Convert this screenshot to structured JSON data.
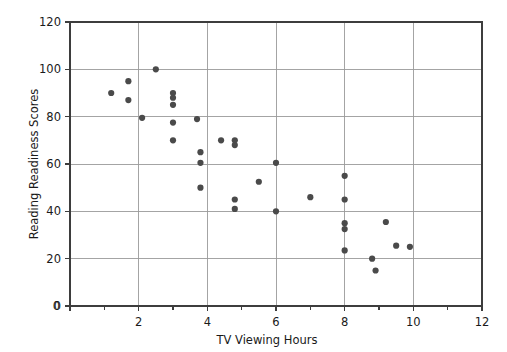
{
  "chart_data": {
    "type": "scatter",
    "title": "",
    "xlabel": "TV Viewing Hours",
    "ylabel": "Reading Readiness Scores",
    "xlim": [
      0,
      12
    ],
    "ylim": [
      0,
      120
    ],
    "x_ticks_major": [
      0,
      2,
      4,
      6,
      8,
      10,
      12
    ],
    "x_tick_labels": [
      "0",
      "2",
      "4",
      "6",
      "8",
      "10",
      "12"
    ],
    "x_ticks_minor": [
      1,
      3,
      5,
      7,
      9,
      11
    ],
    "y_ticks_major": [
      0,
      20,
      40,
      60,
      80,
      100,
      120
    ],
    "y_tick_labels": [
      "0",
      "20",
      "40",
      "60",
      "80",
      "100",
      "120"
    ],
    "grid": "both-major-gridlines",
    "legend": "none",
    "marker_color": "#4a4a4a",
    "marker_shape": "circle",
    "grid_color": "#9a9a9a",
    "frame_color": "#3d3d3d",
    "points": [
      {
        "x": 1.2,
        "y": 90
      },
      {
        "x": 1.7,
        "y": 95
      },
      {
        "x": 1.7,
        "y": 87
      },
      {
        "x": 2.1,
        "y": 79.5
      },
      {
        "x": 2.5,
        "y": 100
      },
      {
        "x": 3.0,
        "y": 90
      },
      {
        "x": 3.0,
        "y": 88
      },
      {
        "x": 3.0,
        "y": 85
      },
      {
        "x": 3.0,
        "y": 77.5
      },
      {
        "x": 3.0,
        "y": 70
      },
      {
        "x": 3.7,
        "y": 79
      },
      {
        "x": 3.8,
        "y": 65
      },
      {
        "x": 3.8,
        "y": 60.5
      },
      {
        "x": 3.8,
        "y": 50
      },
      {
        "x": 4.4,
        "y": 70
      },
      {
        "x": 4.8,
        "y": 70
      },
      {
        "x": 4.8,
        "y": 68
      },
      {
        "x": 4.8,
        "y": 45
      },
      {
        "x": 4.8,
        "y": 41
      },
      {
        "x": 5.5,
        "y": 52.5
      },
      {
        "x": 6.0,
        "y": 60.5
      },
      {
        "x": 6.0,
        "y": 40
      },
      {
        "x": 7.0,
        "y": 46
      },
      {
        "x": 8.0,
        "y": 55
      },
      {
        "x": 8.0,
        "y": 45
      },
      {
        "x": 8.0,
        "y": 35
      },
      {
        "x": 8.0,
        "y": 32.5
      },
      {
        "x": 8.0,
        "y": 23.5
      },
      {
        "x": 8.8,
        "y": 20
      },
      {
        "x": 8.9,
        "y": 15
      },
      {
        "x": 9.2,
        "y": 35.5
      },
      {
        "x": 9.5,
        "y": 25.5
      },
      {
        "x": 9.9,
        "y": 25
      }
    ]
  },
  "geometry": {
    "plot_left": 70,
    "plot_right": 482,
    "plot_top": 22,
    "plot_bottom": 306,
    "marker_radius": 3.1,
    "tick_len_major": 5,
    "tick_len_minor": 4
  }
}
